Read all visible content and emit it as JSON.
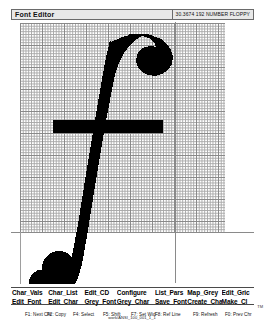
{
  "window": {
    "title": "Font Editor",
    "info": "30.3674  192 NUMBER FLOPPY"
  },
  "editor": {
    "glyph_name": "f",
    "grid_columns": 74,
    "grid_rows": 76
  },
  "menu": {
    "row1": [
      "Char_Vals",
      "Char_List",
      "Edit_CD",
      "Configure",
      "List_Pars",
      "Map_Grey",
      "Edit_Gric"
    ],
    "row2": [
      "Edit_Font",
      "Edit_Char",
      "Grey_Font",
      "Grey_Char",
      "Save_Font",
      "Create_Char",
      "Make_Cl"
    ]
  },
  "status": {
    "path": "work/ANSI_100_001_1_1",
    "keys": [
      "F1: Next Chr",
      "F2: Copy",
      "F4: Select",
      "F5: Shift",
      "F7: Set Wid",
      "F8: Ref Line",
      "F9: Refresh",
      "F0: Prev Chr"
    ],
    "corner": "TM"
  },
  "colors": {
    "glyph": "#000000",
    "grid_minor": "#9a9a9a",
    "grid_major": "#6f6f6f",
    "guide": "#8a8a8a",
    "titlebar_bg": "#e8e8e8",
    "border": "#4a4a4a",
    "background": "#ffffff"
  }
}
